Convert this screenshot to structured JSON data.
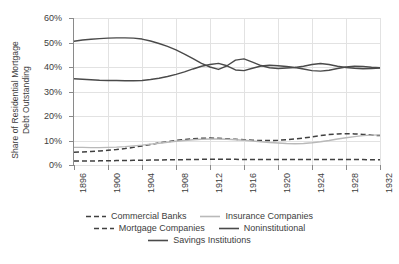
{
  "chart_data": {
    "type": "line",
    "title": "",
    "xlabel": "",
    "ylabel": "Share of Residential Mortgage\nDebt Outstanding",
    "xlim": [
      1896,
      1932
    ],
    "ylim": [
      0,
      60
    ],
    "yunit": "%",
    "grid": true,
    "legend_position": "bottom",
    "ytick_labels": [
      "0%",
      "10%",
      "20%",
      "30%",
      "40%",
      "50%",
      "60%"
    ],
    "ytick_values": [
      0,
      10,
      20,
      30,
      40,
      50,
      60
    ],
    "xtick_labels": [
      "1896",
      "1900",
      "1904",
      "1908",
      "1912",
      "1916",
      "1920",
      "1924",
      "1928",
      "1932"
    ],
    "xtick_values": [
      1896,
      1900,
      1904,
      1908,
      1912,
      1916,
      1920,
      1924,
      1928,
      1932
    ],
    "x": [
      1896,
      1897,
      1898,
      1899,
      1900,
      1901,
      1902,
      1903,
      1904,
      1905,
      1906,
      1907,
      1908,
      1909,
      1910,
      1911,
      1912,
      1913,
      1914,
      1915,
      1916,
      1917,
      1918,
      1919,
      1920,
      1921,
      1922,
      1923,
      1924,
      1925,
      1926,
      1927,
      1928,
      1929,
      1930,
      1931,
      1932
    ],
    "series": [
      {
        "name": "Commercial Banks",
        "style": "dashed",
        "color": "#404040",
        "values": [
          5.2,
          5.3,
          5.5,
          5.7,
          6.0,
          6.3,
          6.7,
          7.2,
          7.8,
          8.4,
          9.0,
          9.5,
          10.0,
          10.4,
          10.7,
          10.9,
          11.0,
          10.9,
          10.7,
          10.5,
          10.3,
          10.1,
          10.0,
          10.0,
          10.1,
          10.3,
          10.6,
          11.0,
          11.5,
          12.0,
          12.4,
          12.7,
          12.8,
          12.7,
          12.5,
          12.2,
          12.0
        ]
      },
      {
        "name": "Insurance Companies",
        "style": "solid",
        "color": "#b9b9b9",
        "values": [
          7.2,
          7.2,
          7.1,
          7.1,
          7.2,
          7.3,
          7.5,
          7.8,
          8.1,
          8.5,
          8.9,
          9.3,
          9.7,
          10.0,
          10.3,
          10.5,
          10.6,
          10.6,
          10.5,
          10.3,
          10.1,
          9.8,
          9.5,
          9.2,
          9.0,
          8.8,
          8.7,
          8.8,
          9.1,
          9.5,
          10.0,
          10.6,
          11.1,
          11.6,
          12.0,
          12.2,
          12.3
        ]
      },
      {
        "name": "Mortgage Companies",
        "style": "dashed",
        "color": "#404040",
        "values": [
          1.6,
          1.6,
          1.6,
          1.7,
          1.7,
          1.8,
          1.8,
          1.9,
          1.9,
          2.0,
          2.0,
          2.1,
          2.1,
          2.2,
          2.2,
          2.3,
          2.3,
          2.3,
          2.3,
          2.3,
          2.2,
          2.2,
          2.2,
          2.2,
          2.2,
          2.2,
          2.2,
          2.2,
          2.2,
          2.2,
          2.2,
          2.2,
          2.2,
          2.2,
          2.2,
          2.1,
          2.1
        ]
      },
      {
        "name": "Noninstitutional",
        "style": "solid",
        "color": "#4a4a4a",
        "values": [
          50.5,
          51.0,
          51.3,
          51.6,
          51.8,
          51.9,
          51.9,
          51.8,
          51.4,
          50.6,
          49.6,
          48.4,
          47.0,
          45.3,
          43.4,
          41.5,
          40.0,
          39.0,
          40.5,
          42.8,
          43.3,
          42.0,
          40.6,
          39.7,
          39.4,
          39.6,
          39.8,
          40.3,
          41.0,
          41.4,
          41.0,
          40.3,
          39.8,
          39.5,
          39.3,
          39.4,
          39.6
        ]
      },
      {
        "name": "Savings Institutions",
        "style": "solid",
        "color": "#4a4a4a",
        "values": [
          35.2,
          35.0,
          34.8,
          34.6,
          34.5,
          34.5,
          34.4,
          34.4,
          34.5,
          34.9,
          35.4,
          36.1,
          37.0,
          38.0,
          39.2,
          40.3,
          41.0,
          41.5,
          40.5,
          38.8,
          38.5,
          39.5,
          40.4,
          40.7,
          40.5,
          40.2,
          39.8,
          39.2,
          38.5,
          38.3,
          38.7,
          39.4,
          40.0,
          40.3,
          40.2,
          39.9,
          39.7
        ]
      }
    ]
  },
  "legend": {
    "rows": [
      [
        {
          "label": "Commercial Banks",
          "style": "dashed",
          "color": "#404040"
        },
        {
          "label": "Insurance Companies",
          "style": "solid",
          "color": "#b9b9b9"
        }
      ],
      [
        {
          "label": "Mortgage Companies",
          "style": "dashed",
          "color": "#404040"
        },
        {
          "label": "Noninstitutional",
          "style": "solid",
          "color": "#4a4a4a"
        }
      ],
      [
        {
          "label": "Savings Institutions",
          "style": "solid",
          "color": "#4a4a4a"
        }
      ]
    ]
  }
}
